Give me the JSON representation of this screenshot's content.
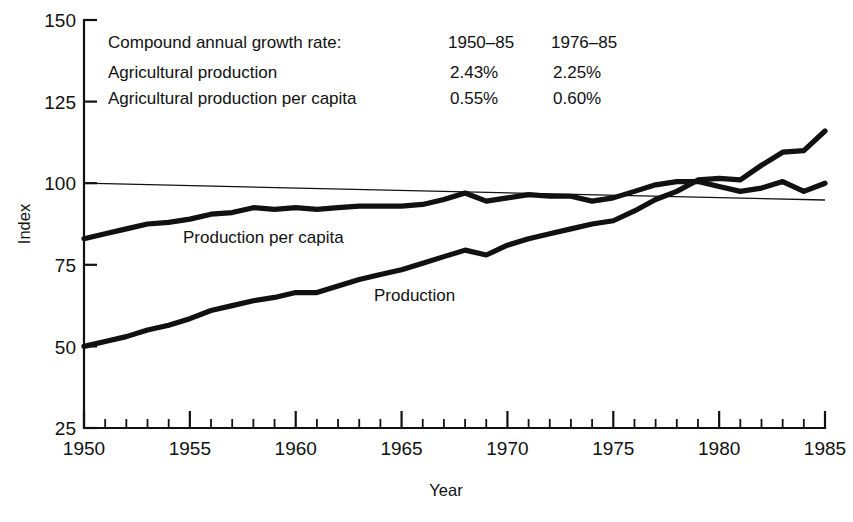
{
  "chart_data": {
    "type": "line",
    "title": "",
    "xlabel": "Year",
    "ylabel": "Index",
    "xlim": [
      1950,
      1985
    ],
    "ylim": [
      25,
      150
    ],
    "ytick_labels": [
      "150",
      "125",
      "100",
      "75",
      "50",
      "25"
    ],
    "yticks": [
      150,
      125,
      100,
      75,
      50,
      25
    ],
    "xtick_labels": [
      "1950",
      "1955",
      "1960",
      "1965",
      "1970",
      "1975",
      "1980",
      "1985"
    ],
    "xticks": [
      1950,
      1955,
      1960,
      1965,
      1970,
      1975,
      1980,
      1985
    ],
    "minor_xtick_interval": 1,
    "grid": false,
    "legend_position": "inline-labels",
    "reference_line": {
      "label": "100 index reference",
      "value": 100
    },
    "x": [
      1950,
      1951,
      1952,
      1953,
      1954,
      1955,
      1956,
      1957,
      1958,
      1959,
      1960,
      1961,
      1962,
      1963,
      1964,
      1965,
      1966,
      1967,
      1968,
      1969,
      1970,
      1971,
      1972,
      1973,
      1974,
      1975,
      1976,
      1977,
      1978,
      1979,
      1980,
      1981,
      1982,
      1983,
      1984,
      1985
    ],
    "series": [
      {
        "name": "Production",
        "label": "Production",
        "values": [
          50.0,
          51.5,
          53.0,
          55.0,
          56.5,
          58.5,
          61.0,
          62.5,
          64.0,
          65.0,
          66.5,
          66.5,
          68.5,
          70.5,
          72.0,
          73.5,
          75.5,
          77.5,
          79.5,
          78.0,
          81.0,
          83.0,
          84.5,
          86.0,
          87.5,
          88.5,
          91.5,
          95.0,
          97.5,
          101.0,
          101.5,
          101.0,
          105.5,
          109.5,
          110.0,
          116.0
        ]
      },
      {
        "name": "Production per capita",
        "label": "Production per capita",
        "values": [
          83.0,
          84.5,
          86.0,
          87.5,
          88.0,
          89.0,
          90.5,
          91.0,
          92.5,
          92.0,
          92.5,
          92.0,
          92.5,
          93.0,
          93.0,
          93.0,
          93.5,
          95.0,
          97.0,
          94.5,
          95.5,
          96.5,
          96.0,
          96.0,
          94.5,
          95.5,
          97.5,
          99.5,
          100.5,
          100.5,
          99.0,
          97.5,
          98.5,
          100.5,
          97.5,
          100.0
        ]
      }
    ]
  },
  "notes": {
    "heading": "Compound annual growth rate:",
    "column_headers": [
      "1950–85",
      "1976–85"
    ],
    "rows": [
      {
        "label": "Agricultural production",
        "values": [
          "2.43%",
          "2.25%"
        ]
      },
      {
        "label": "Agricultural production per capita",
        "values": [
          "0.55%",
          "0.60%"
        ]
      }
    ]
  },
  "colors": {
    "ink": "#111111",
    "background": "#ffffff"
  }
}
